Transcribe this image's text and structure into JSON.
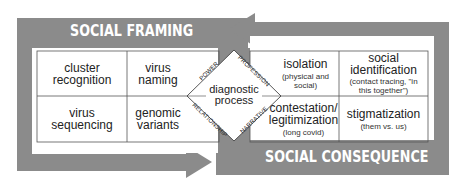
{
  "diagram": {
    "colors": {
      "frame": "#8b8b8b",
      "background": "#ffffff",
      "text": "#222222",
      "banner_text": "#ffffff"
    },
    "top_banner": {
      "label": "SOCIAL FRAMING"
    },
    "bottom_banner": {
      "label": "SOCIAL CONSEQUENCE"
    },
    "center": {
      "label_line1": "diagnostic",
      "label_line2": "process",
      "facets": {
        "top_left": "POWER",
        "top_right": "PROFESSION",
        "bottom_left": "RELATIONSHIP",
        "bottom_right": "NARRATIVE"
      }
    },
    "left_grid": [
      {
        "main": "cluster recognition"
      },
      {
        "main": "virus naming"
      },
      {
        "main": "virus sequencing"
      },
      {
        "main": "genomic variants"
      }
    ],
    "right_grid": [
      {
        "main": "isolation",
        "sub": "(physical and social)"
      },
      {
        "main_line1": "social",
        "main_line2": "identification",
        "sub_line1": "(contact tracing, \"in",
        "sub_line2": "this together\")"
      },
      {
        "main_line1": "contestation/",
        "main_line2": "legitimization",
        "sub": "(long covid)"
      },
      {
        "main": "stigmatization",
        "sub": "(them vs. us)"
      }
    ],
    "arrows": {
      "top": "arrow-left",
      "bottom": "arrow-right"
    }
  }
}
